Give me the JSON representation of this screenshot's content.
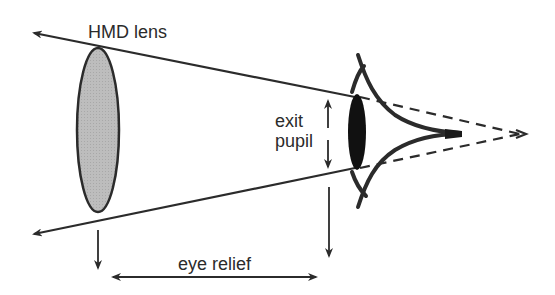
{
  "diagram": {
    "labels": {
      "lens": "HMD lens",
      "exit_pupil_line1": "exit",
      "exit_pupil_line2": "pupil",
      "eye_relief": "eye relief"
    },
    "colors": {
      "stroke": "#2b2b2b",
      "lens_fill": "#bdbdbd",
      "pupil_fill": "#111111",
      "background": "#ffffff"
    },
    "elements": [
      "hmd-lens-ellipse",
      "upper-ray-arrow",
      "lower-ray-arrow",
      "exit-pupil-double-arrow",
      "eye-relief-double-arrow",
      "lens-drop-arrow",
      "pupil-drop-arrow",
      "eye-outline",
      "eye-pupil",
      "dashed-convergence-lines"
    ]
  }
}
